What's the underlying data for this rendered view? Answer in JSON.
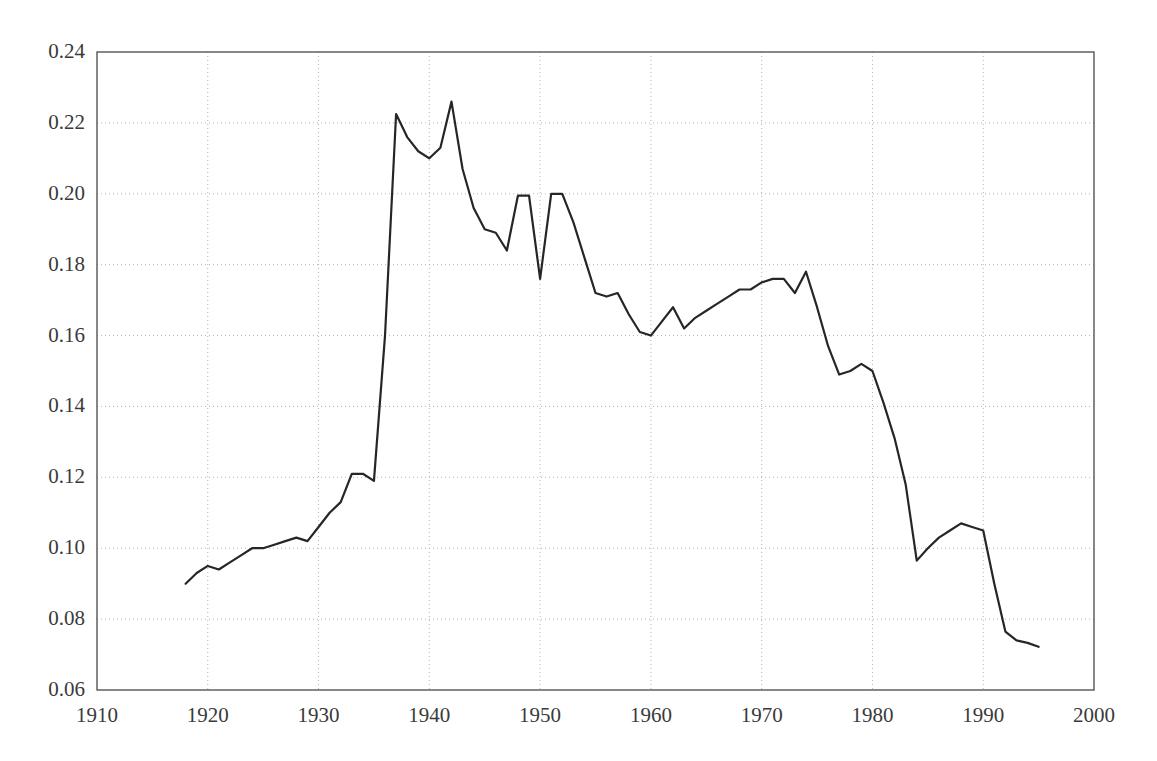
{
  "chart_data": {
    "type": "line",
    "title": "",
    "subtitle": "",
    "xlabel": "",
    "ylabel": "",
    "xlim": [
      1910,
      2000
    ],
    "ylim": [
      0.06,
      0.24
    ],
    "xticks": [
      1910,
      1920,
      1930,
      1940,
      1950,
      1960,
      1970,
      1980,
      1990,
      2000
    ],
    "xtick_labels": [
      "1910",
      "1920",
      "1930",
      "1940",
      "1950",
      "1960",
      "1970",
      "1980",
      "1990",
      "2000"
    ],
    "yticks": [
      0.06,
      0.08,
      0.1,
      0.12,
      0.14,
      0.16,
      0.18,
      0.2,
      0.22,
      0.24
    ],
    "ytick_labels": [
      "0.06",
      "0.08",
      "0.10",
      "0.12",
      "0.14",
      "0.16",
      "0.18",
      "0.20",
      "0.22",
      "0.24"
    ],
    "grid": true,
    "grid_style": "dotted",
    "grid_color": "#b4b4b4",
    "legend": null,
    "legend_position": "none",
    "annotations": [],
    "line_color": "#262626",
    "line_width": 2.2,
    "axis_color": "#555555",
    "background_color": "#ffffff",
    "series": [
      {
        "name": "series-1",
        "x": [
          1918,
          1919,
          1920,
          1921,
          1922,
          1923,
          1924,
          1925,
          1926,
          1927,
          1928,
          1929,
          1930,
          1931,
          1932,
          1933,
          1934,
          1935,
          1936,
          1937,
          1938,
          1939,
          1940,
          1941,
          1942,
          1943,
          1944,
          1945,
          1946,
          1947,
          1948,
          1949,
          1950,
          1951,
          1952,
          1953,
          1954,
          1955,
          1956,
          1957,
          1958,
          1959,
          1960,
          1961,
          1962,
          1963,
          1964,
          1965,
          1966,
          1967,
          1968,
          1969,
          1970,
          1971,
          1972,
          1973,
          1974,
          1975,
          1976,
          1977,
          1978,
          1979,
          1980,
          1981,
          1982,
          1983,
          1984,
          1985,
          1986,
          1987,
          1988,
          1989,
          1990,
          1991,
          1992,
          1993,
          1994,
          1995
        ],
        "y": [
          0.09,
          0.093,
          0.095,
          0.094,
          0.096,
          0.098,
          0.1,
          0.1,
          0.101,
          0.102,
          0.103,
          0.102,
          0.106,
          0.11,
          0.113,
          0.121,
          0.121,
          0.119,
          0.16,
          0.2225,
          0.216,
          0.212,
          0.21,
          0.213,
          0.226,
          0.207,
          0.196,
          0.19,
          0.189,
          0.184,
          0.1995,
          0.1995,
          0.176,
          0.2,
          0.2,
          0.192,
          0.182,
          0.172,
          0.171,
          0.172,
          0.166,
          0.161,
          0.16,
          0.164,
          0.168,
          0.162,
          0.165,
          0.167,
          0.169,
          0.171,
          0.173,
          0.173,
          0.175,
          0.176,
          0.176,
          0.172,
          0.178,
          0.168,
          0.157,
          0.149,
          0.15,
          0.152,
          0.15,
          0.141,
          0.131,
          0.118,
          0.0965,
          0.1,
          0.103,
          0.105,
          0.107,
          0.106,
          0.105,
          0.09,
          0.0765,
          0.074,
          0.0733,
          0.0722
        ]
      }
    ]
  },
  "plot_geometry": {
    "left": 97,
    "right": 1094,
    "top": 52,
    "bottom": 690
  }
}
